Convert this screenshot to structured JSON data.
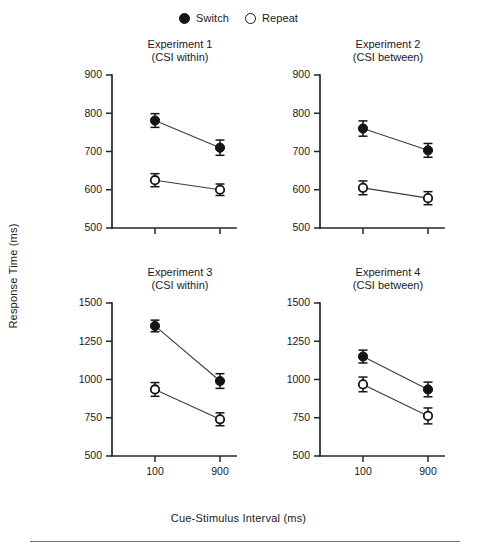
{
  "legend": {
    "entries": [
      {
        "label": "Switch",
        "marker": "filled-circle-icon"
      },
      {
        "label": "Repeat",
        "marker": "open-circle-icon"
      }
    ]
  },
  "axes": {
    "y_title": "Response Time (ms)",
    "x_title": "Cue-Stimulus Interval (ms)"
  },
  "chart_data": {
    "type": "line",
    "xlabel": "Cue-Stimulus Interval (ms)",
    "ylabel": "Response Time (ms)",
    "x": [
      100,
      900
    ],
    "xtick_labels": [
      "100",
      "900"
    ],
    "grid": false,
    "legend_position": "top-center",
    "error_bars": "standard error",
    "panels": [
      {
        "title": "Experiment 1",
        "subtitle": "(CSI within)",
        "ylim": [
          500,
          900
        ],
        "yticks": [
          500,
          600,
          700,
          800,
          900
        ],
        "ytick_labels": [
          "500",
          "600",
          "700",
          "800",
          "900"
        ],
        "series": [
          {
            "name": "Switch",
            "marker": "filled-circle-icon",
            "values": [
              781,
              710
            ],
            "errors": [
              18,
              20
            ]
          },
          {
            "name": "Repeat",
            "marker": "open-circle-icon",
            "values": [
              625,
              600
            ],
            "errors": [
              17,
              15
            ]
          }
        ]
      },
      {
        "title": "Experiment 2",
        "subtitle": "(CSI between)",
        "ylim": [
          500,
          900
        ],
        "yticks": [
          500,
          600,
          700,
          800,
          900
        ],
        "ytick_labels": [
          "500",
          "600",
          "700",
          "800",
          "900"
        ],
        "series": [
          {
            "name": "Switch",
            "marker": "filled-circle-icon",
            "values": [
              760,
              703
            ],
            "errors": [
              20,
              18
            ]
          },
          {
            "name": "Repeat",
            "marker": "open-circle-icon",
            "values": [
              605,
              578
            ],
            "errors": [
              18,
              17
            ]
          }
        ]
      },
      {
        "title": "Experiment 3",
        "subtitle": "(CSI within)",
        "ylim": [
          500,
          1500
        ],
        "yticks": [
          500,
          750,
          1000,
          1250,
          1500
        ],
        "ytick_labels": [
          "500",
          "750",
          "1000",
          "1250",
          "1500"
        ],
        "series": [
          {
            "name": "Switch",
            "marker": "filled-circle-icon",
            "values": [
              1350,
              990
            ],
            "errors": [
              38,
              48
            ]
          },
          {
            "name": "Repeat",
            "marker": "open-circle-icon",
            "values": [
              935,
              740
            ],
            "errors": [
              45,
              42
            ]
          }
        ]
      },
      {
        "title": "Experiment 4",
        "subtitle": "(CSI between)",
        "ylim": [
          500,
          1500
        ],
        "yticks": [
          500,
          750,
          1000,
          1250,
          1500
        ],
        "ytick_labels": [
          "500",
          "750",
          "1000",
          "1250",
          "1500"
        ],
        "series": [
          {
            "name": "Switch",
            "marker": "filled-circle-icon",
            "values": [
              1150,
              935
            ],
            "errors": [
              42,
              48
            ]
          },
          {
            "name": "Repeat",
            "marker": "open-circle-icon",
            "values": [
              968,
              762
            ],
            "errors": [
              48,
              52
            ]
          }
        ]
      }
    ]
  }
}
